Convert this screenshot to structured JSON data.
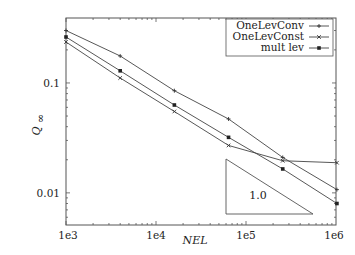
{
  "chart_data": {
    "type": "line",
    "title": "",
    "xlabel": "NEL",
    "ylabel": "Q∞",
    "xscale": "log",
    "yscale": "log",
    "xlim": [
      1000,
      1000000
    ],
    "ylim": [
      0.0051,
      0.39
    ],
    "grid": false,
    "legend_position": "top-right",
    "x_ticks": [
      1000,
      10000,
      100000,
      1000000
    ],
    "x_tick_labels": [
      "1e3",
      "1e4",
      "1e5",
      "1e6"
    ],
    "y_ticks": [
      0.01,
      0.1
    ],
    "y_tick_labels": [
      "0.01",
      "0.1"
    ],
    "x": [
      1000,
      4000,
      16000,
      64000,
      256000,
      1024000
    ],
    "series": [
      {
        "name": "OneLevConv",
        "marker": "plus",
        "values": [
          0.3,
          0.176,
          0.085,
          0.047,
          0.021,
          0.0107
        ]
      },
      {
        "name": "OneLevConst",
        "marker": "cross",
        "values": [
          0.236,
          0.111,
          0.055,
          0.027,
          0.0196,
          0.0188
        ]
      },
      {
        "name": "mult lev",
        "marker": "filled-square",
        "values": [
          0.262,
          0.129,
          0.063,
          0.032,
          0.0165,
          0.008
        ]
      }
    ],
    "annotations": [
      {
        "type": "slope-triangle",
        "label": "1.0",
        "x_from": 65000,
        "x_to": 600000,
        "slope": -1.0
      }
    ]
  },
  "labels": {
    "xlabel": "NEL",
    "ylabel_main": "Q",
    "ylabel_sub": "∞",
    "x_ticks": [
      "1e3",
      "1e4",
      "1e5",
      "1e6"
    ],
    "y_ticks": [
      "0.1",
      "0.01"
    ],
    "legend": [
      "OneLevConv",
      "OneLevConst",
      "mult lev"
    ],
    "slope_label": "1.0"
  }
}
